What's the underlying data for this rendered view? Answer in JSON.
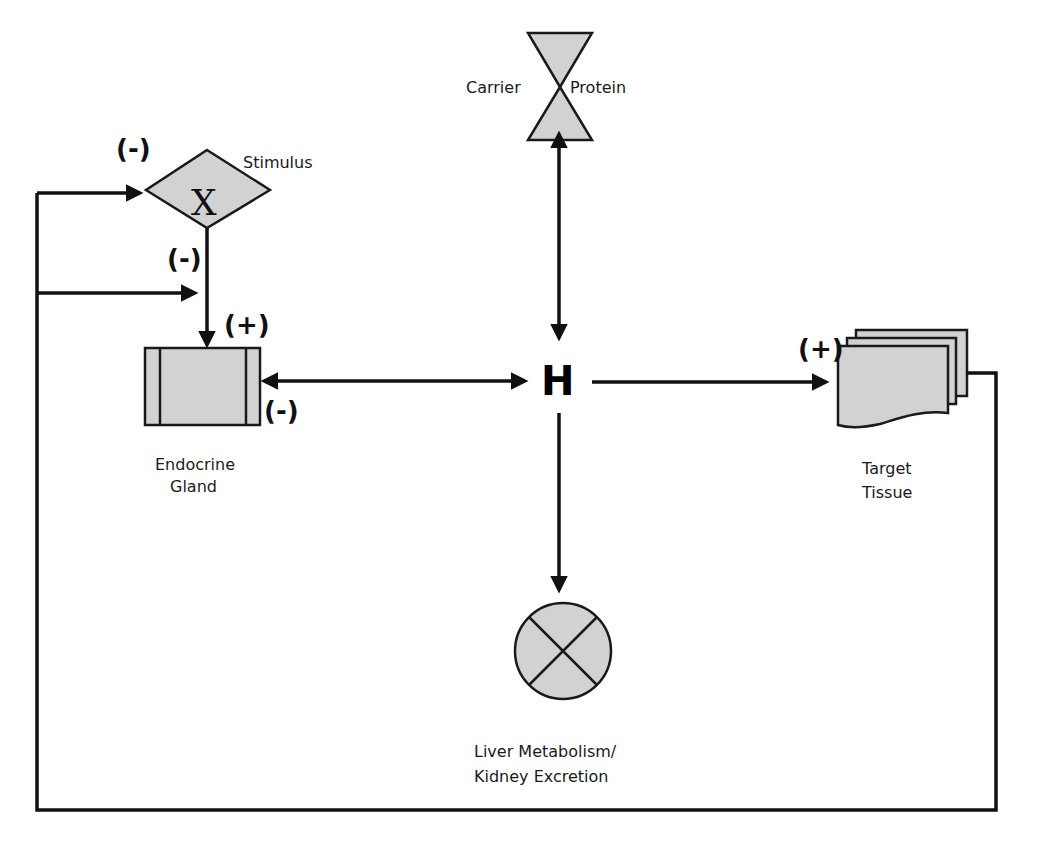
{
  "diagram": {
    "colors": {
      "shape_fill": "#d2d2d2",
      "stroke": "#111111",
      "background": "#ffffff"
    },
    "nodes": {
      "carrier_protein": {
        "label_left": "Carrier",
        "label_right": "Protein",
        "shape": "hourglass"
      },
      "stimulus": {
        "label": "Stimulus",
        "glyph": "X",
        "shape": "diamond",
        "sign": "(-)"
      },
      "endocrine_gland": {
        "label_line1": "Endocrine",
        "label_line2": "Gland",
        "shape": "predefined-process",
        "sign_top": "(+)",
        "sign_right": "(-)"
      },
      "hormone": {
        "label": "H"
      },
      "target_tissue": {
        "label_line1": "Target",
        "label_line2": "Tissue",
        "shape": "multi-document",
        "sign": "(+)"
      },
      "liver_kidney": {
        "label_line1": "Liver Metabolism/",
        "label_line2": "Kidney Excretion",
        "shape": "summing-junction"
      }
    },
    "edges": {
      "stimulus_to_gland_sign": "(-)"
    }
  }
}
